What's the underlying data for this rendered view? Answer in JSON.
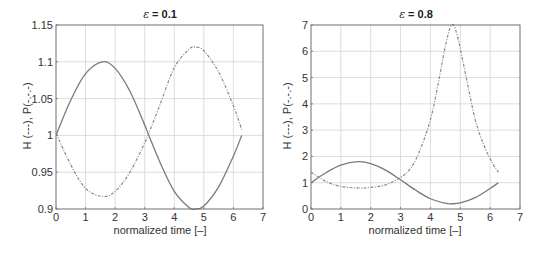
{
  "chart_data": [
    {
      "type": "line",
      "title": "ε = 0.1",
      "title_parts": {
        "symbol": "ε",
        "rest": " = 0.1"
      },
      "xlabel": "normalized time [–]",
      "ylabel": "H (---),   P(-.-.-)",
      "xlim": [
        0,
        7
      ],
      "ylim": [
        0.9,
        1.15
      ],
      "xticks": [
        0,
        1,
        2,
        3,
        4,
        5,
        6,
        7
      ],
      "yticks": [
        0.9,
        0.95,
        1,
        1.05,
        1.1,
        1.15
      ],
      "ytick_labels": [
        "0.9",
        "0.95",
        "1",
        "1.05",
        "1.1",
        "1.15"
      ],
      "grid": true,
      "legend": "none (described in y-axis label)",
      "series": [
        {
          "name": "H",
          "style": "solid",
          "x": [
            0,
            0.5,
            1.0,
            1.57,
            2.0,
            2.5,
            3.0,
            3.14,
            3.5,
            4.0,
            4.5,
            4.71,
            5.0,
            5.5,
            6.0,
            6.28
          ],
          "y": [
            1.0,
            1.048,
            1.084,
            1.1,
            1.091,
            1.06,
            1.014,
            1.0,
            0.965,
            0.924,
            0.902,
            0.9,
            0.904,
            0.93,
            0.972,
            1.0
          ]
        },
        {
          "name": "P",
          "style": "dash-dot",
          "x": [
            0,
            0.5,
            1.0,
            1.57,
            2.0,
            2.5,
            3.0,
            3.14,
            3.5,
            4.0,
            4.5,
            4.71,
            5.0,
            5.5,
            6.0,
            6.28
          ],
          "y": [
            1.003,
            0.96,
            0.928,
            0.917,
            0.924,
            0.95,
            0.99,
            1.003,
            1.04,
            1.092,
            1.117,
            1.12,
            1.115,
            1.086,
            1.04,
            1.008
          ]
        }
      ]
    },
    {
      "type": "line",
      "title": "ε = 0.8",
      "title_parts": {
        "symbol": "ε",
        "rest": " = 0.8"
      },
      "xlabel": "normalized time [–]",
      "ylabel": "H (---),   P(-.-.-)",
      "xlim": [
        0,
        7
      ],
      "ylim": [
        0,
        7
      ],
      "xticks": [
        0,
        1,
        2,
        3,
        4,
        5,
        6,
        7
      ],
      "yticks": [
        0,
        1,
        2,
        3,
        4,
        5,
        6,
        7
      ],
      "ytick_labels": [
        "0",
        "1",
        "2",
        "3",
        "4",
        "5",
        "6",
        "7"
      ],
      "grid": true,
      "legend": "none (described in y-axis label)",
      "series": [
        {
          "name": "H",
          "style": "solid",
          "x": [
            0,
            0.5,
            1.0,
            1.57,
            2.0,
            2.5,
            3.0,
            3.5,
            4.0,
            4.5,
            4.71,
            5.0,
            5.5,
            6.0,
            6.28
          ],
          "y": [
            1.0,
            1.38,
            1.67,
            1.8,
            1.73,
            1.48,
            1.11,
            0.72,
            0.39,
            0.22,
            0.2,
            0.23,
            0.43,
            0.78,
            1.0
          ]
        },
        {
          "name": "P",
          "style": "dash-dot",
          "x": [
            0,
            0.5,
            1.0,
            1.57,
            2.0,
            2.5,
            3.0,
            3.3,
            3.6,
            4.0,
            4.3,
            4.5,
            4.71,
            4.9,
            5.2,
            5.5,
            5.8,
            6.1,
            6.28
          ],
          "y": [
            1.4,
            1.05,
            0.86,
            0.8,
            0.82,
            0.92,
            1.2,
            1.5,
            2.1,
            3.4,
            5.0,
            6.2,
            7.0,
            6.6,
            5.0,
            3.4,
            2.4,
            1.7,
            1.4
          ]
        }
      ]
    }
  ]
}
